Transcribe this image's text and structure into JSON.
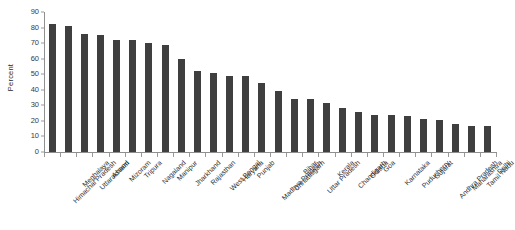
{
  "chart_data": {
    "type": "bar",
    "title": "",
    "xlabel": "",
    "ylabel": "Percent",
    "ylim": [
      0,
      90
    ],
    "ytick_step": 10,
    "yticks": [
      0,
      10,
      20,
      30,
      40,
      50,
      60,
      70,
      80,
      90
    ],
    "grid": false,
    "legend": null,
    "bar_color": "#3f3f3f",
    "axis_color": "#8f8f8f",
    "categories": [
      "Himachal Pradesh",
      "Meghalaya",
      "Uttarakhand",
      "Assam",
      "Mizoram",
      "Tripura",
      "Nagaland",
      "Manipur",
      "Jharkhand",
      "Rajasthan",
      "West Bengal",
      "Haryana",
      "Punjab",
      "Madhya Pradesh",
      "Chhattisgarh",
      "Bihar",
      "Uttar Pradesh",
      "Kerala",
      "Chandigarh",
      "Odisha",
      "Goa",
      "Karnataka",
      "Puducherry",
      "Gujarat",
      "Andhra Pradesh",
      "Maharashtra",
      "Tamil Nadu",
      "Delhi"
    ],
    "values": [
      82,
      81,
      76,
      75,
      72,
      72,
      70,
      69,
      60,
      52,
      51,
      49,
      49,
      44.5,
      39.5,
      34,
      34,
      31.5,
      28,
      26,
      23.5,
      23.5,
      23,
      21,
      20.5,
      18,
      17,
      17
    ]
  }
}
